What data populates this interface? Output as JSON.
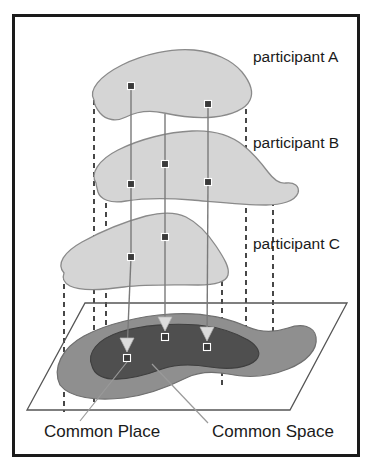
{
  "figure": {
    "frame": {
      "border_color": "#1a1a1a",
      "background_color": "#ffffff"
    },
    "colors": {
      "participant_blob_fill": "#d5d5d5",
      "participant_blob_stroke": "#8a8a8a",
      "common_space_fill": "#8f8f8f",
      "common_space_stroke": "#6f6f6f",
      "common_place_fill": "#4f4f4f",
      "common_place_stroke": "#3f3f3f",
      "marker_color": "#3a3a3a",
      "connector_color": "#7a7a7a",
      "projection_line_color": "#1a1a1a",
      "arrowhead_color": "#d9d9d9",
      "leader_line_color": "#9a9a9a",
      "plane_stroke": "#555555",
      "text_color": "#1a1a1a"
    },
    "layers": [
      {
        "id": "participant-a",
        "label": "participant A",
        "label_x": 253,
        "label_y": 62,
        "markers": [
          {
            "id": "a-m1",
            "x": 131,
            "y": 86
          },
          {
            "id": "a-m2",
            "x": 208,
            "y": 104
          }
        ]
      },
      {
        "id": "participant-b",
        "label": "participant B",
        "label_x": 253,
        "label_y": 148,
        "markers": [
          {
            "id": "b-m1",
            "x": 165,
            "y": 164
          },
          {
            "id": "b-m2",
            "x": 131,
            "y": 184
          },
          {
            "id": "b-m3",
            "x": 208,
            "y": 182
          }
        ]
      },
      {
        "id": "participant-c",
        "label": "participant C",
        "label_x": 253,
        "label_y": 249,
        "markers": [
          {
            "id": "c-m1",
            "x": 165,
            "y": 237
          },
          {
            "id": "c-m2",
            "x": 131,
            "y": 257
          }
        ]
      }
    ],
    "ground_plane": {
      "id": "common-ground-plane",
      "points": "85,303 347,303 290,410 27,410"
    },
    "common_space": {
      "id": "common-space-blob",
      "label": "Common Space",
      "label_x": 212,
      "label_y": 437
    },
    "common_place": {
      "id": "common-place-blob",
      "label": "Common Place",
      "label_x": 44,
      "label_y": 437,
      "markers": [
        {
          "id": "p-m1",
          "x": 127,
          "y": 358
        },
        {
          "id": "p-m2",
          "x": 165,
          "y": 337
        },
        {
          "id": "p-m3",
          "x": 207,
          "y": 347
        }
      ]
    },
    "projection_arrows": [
      {
        "id": "arrow-left",
        "x": 127,
        "y": 347
      },
      {
        "id": "arrow-middle",
        "x": 165,
        "y": 326
      },
      {
        "id": "arrow-right",
        "x": 207,
        "y": 336
      }
    ],
    "dashed_projection_lines": [
      {
        "id": "dash-a-left",
        "x": 94,
        "y1": 100,
        "y2": 404
      },
      {
        "id": "dash-a-right",
        "x": 246,
        "y1": 100,
        "y2": 370
      },
      {
        "id": "dash-b-left",
        "x": 106,
        "y1": 185,
        "y2": 398
      },
      {
        "id": "dash-b-right",
        "x": 273,
        "y1": 183,
        "y2": 360
      },
      {
        "id": "dash-c-left",
        "x": 64,
        "y1": 275,
        "y2": 412
      },
      {
        "id": "dash-c-right",
        "x": 222,
        "y1": 272,
        "y2": 388
      }
    ],
    "leader_lines": [
      {
        "id": "leader-common-place",
        "x1": 127,
        "y1": 362,
        "x2": 80,
        "y2": 421
      },
      {
        "id": "leader-common-space",
        "x1": 152,
        "y1": 364,
        "x2": 208,
        "y2": 423
      }
    ]
  }
}
